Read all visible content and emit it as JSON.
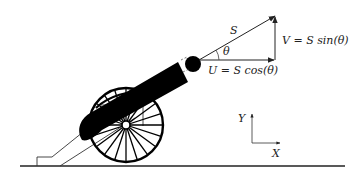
{
  "diagram": {
    "vectors": {
      "resultant": {
        "label": "S"
      },
      "angle": {
        "label": "θ"
      },
      "vertical": {
        "label": "V = S sin(θ)"
      },
      "horizontal": {
        "label": "U = S cos(θ)"
      }
    },
    "axes": {
      "y_label": "Y",
      "x_label": "X"
    },
    "colors": {
      "ink": "#000000",
      "line": "#333333",
      "background": "#ffffff"
    },
    "wheel_spokes": 20
  }
}
